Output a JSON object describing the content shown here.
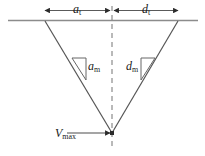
{
  "figure": {
    "type": "velocity-profile-triangle-diagram",
    "labels": {
      "accel_time": "a",
      "accel_time_sub": "t",
      "decel_time": "d",
      "decel_time_sub": "t",
      "accel_rate": "a",
      "accel_rate_sub": "m",
      "decel_rate": "d",
      "decel_rate_sub": "m",
      "velocity_max": "V",
      "velocity_max_sub": "max"
    },
    "colors": {
      "line": "#4d4d4d",
      "ground_line": "#8c8c8c",
      "dashed_center": "#808080",
      "text": "#1a1a1a",
      "background": "#ffffff"
    },
    "geometry": {
      "ground_line_y": 20,
      "ground_line_x1": 8,
      "ground_line_x2": 198,
      "triangle_left_x": 45,
      "triangle_right_x": 178,
      "apex_x": 112,
      "apex_y": 133,
      "dim_arrow_y": 10,
      "dim_left_start_x": 45,
      "dim_center_x": 112,
      "dim_right_end_x": 178
    }
  }
}
